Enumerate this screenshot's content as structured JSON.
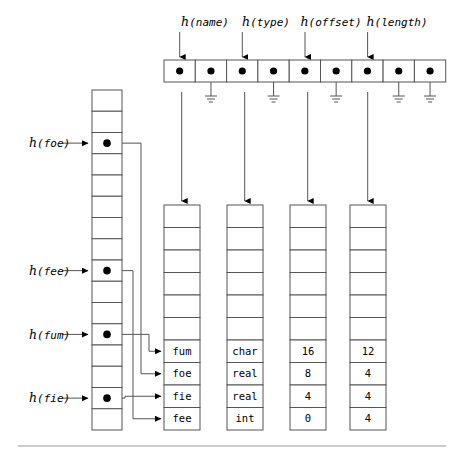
{
  "figure": {
    "bottom_rule": true
  },
  "hash_table": {
    "name": "top-hash-array",
    "cell_count": 9,
    "x": 164,
    "y": 60,
    "cell_width": 31.3,
    "cell_height": 22,
    "cells": [
      {
        "index": 0,
        "has_dot": true,
        "link": "name-column",
        "grounded": false
      },
      {
        "index": 1,
        "has_dot": true,
        "link": null,
        "grounded": true
      },
      {
        "index": 2,
        "has_dot": true,
        "link": "type-column",
        "grounded": false
      },
      {
        "index": 3,
        "has_dot": true,
        "link": null,
        "grounded": true
      },
      {
        "index": 4,
        "has_dot": true,
        "link": "offset-column",
        "grounded": false
      },
      {
        "index": 5,
        "has_dot": true,
        "link": null,
        "grounded": true
      },
      {
        "index": 6,
        "has_dot": true,
        "link": "length-column",
        "grounded": false
      },
      {
        "index": 7,
        "has_dot": true,
        "link": null,
        "grounded": true
      },
      {
        "index": 8,
        "has_dot": true,
        "link": null,
        "grounded": true
      }
    ]
  },
  "top_labels": [
    {
      "h": "h",
      "arg": "(name)",
      "text": "h(name)",
      "x": 205,
      "y": 26,
      "arrow_x": 179.7,
      "arrow_from_y": 32,
      "arrow_to_y": 57
    },
    {
      "h": "h",
      "arg": "(type)",
      "text": "h(type)",
      "x": 266,
      "y": 26,
      "arrow_x": 242.3,
      "arrow_from_y": 32,
      "arrow_to_y": 57
    },
    {
      "h": "h",
      "arg": "(offset)",
      "text": "h(offset)",
      "x": 331,
      "y": 26,
      "arrow_x": 305,
      "arrow_from_y": 32,
      "arrow_to_y": 57
    },
    {
      "h": "h",
      "arg": "(length)",
      "text": "h(length)",
      "x": 397,
      "y": 26,
      "arrow_x": 367.6,
      "arrow_from_y": 32,
      "arrow_to_y": 57
    }
  ],
  "left_table": {
    "name": "left-hash-array",
    "x": 92,
    "y": 90,
    "width": 30,
    "cell_count": 16,
    "cell_height": 21.25,
    "dot_rows": [
      2,
      8,
      11,
      14
    ]
  },
  "left_labels": [
    {
      "h": "h",
      "arg": "(foe)",
      "text": "h(foe)",
      "row": 2,
      "label_x": 29,
      "label_y": 151,
      "arrow_x1": 62,
      "arrow_x2": 88,
      "arrow_y": 147
    },
    {
      "h": "h",
      "arg": "(fee)",
      "text": "h(fee)",
      "row": 8,
      "label_x": 29,
      "label_y": 279,
      "arrow_x1": 62,
      "arrow_x2": 88,
      "arrow_y": 275
    },
    {
      "h": "h",
      "arg": "(fum)",
      "text": "h(fum)",
      "row": 11,
      "label_x": 29,
      "label_y": 343,
      "arrow_x1": 62,
      "arrow_x2": 88,
      "arrow_y": 339
    },
    {
      "h": "h",
      "arg": "(fie)",
      "text": "h(fie)",
      "row": 14,
      "label_x": 29,
      "label_y": 407,
      "arrow_x1": 62,
      "arrow_x2": 88,
      "arrow_y": 403
    }
  ],
  "record_columns": [
    {
      "name": "name-column",
      "key": "name",
      "x": 164,
      "y": 205,
      "width": 36,
      "cell_count": 10,
      "cell_height": 22.5,
      "empty_rows": 6,
      "values": [
        "fum",
        "foe",
        "fie",
        "fee"
      ],
      "arrow_x": 181.7,
      "has_incoming_arrows": true
    },
    {
      "name": "type-column",
      "key": "type",
      "x": 227,
      "y": 205,
      "width": 36,
      "cell_count": 10,
      "cell_height": 22.5,
      "empty_rows": 6,
      "values": [
        "char",
        "real",
        "real",
        "int"
      ],
      "arrow_x": 244.7,
      "has_incoming_arrows": false
    },
    {
      "name": "offset-column",
      "key": "offset",
      "x": 290,
      "y": 205,
      "width": 36,
      "cell_count": 10,
      "cell_height": 22.5,
      "empty_rows": 6,
      "values": [
        "16",
        "8",
        "4",
        "0"
      ],
      "arrow_x": 307.7,
      "has_incoming_arrows": false
    },
    {
      "name": "length-column",
      "key": "length",
      "x": 350,
      "y": 205,
      "width": 36,
      "cell_count": 10,
      "cell_height": 22.5,
      "empty_rows": 6,
      "values": [
        "12",
        "4",
        "4",
        "4"
      ],
      "arrow_x": 367.7,
      "has_incoming_arrows": false
    }
  ],
  "bucket_links": [
    {
      "from_label": "h(foe)",
      "to_value": "foe",
      "from_row": 2,
      "to_row": 7,
      "elbow_x": 141
    },
    {
      "from_label": "h(fee)",
      "to_value": "fee",
      "from_row": 8,
      "to_row": 9,
      "elbow_x": 133
    },
    {
      "from_label": "h(fum)",
      "to_value": "fum",
      "from_row": 11,
      "to_row": 6,
      "elbow_x": 149
    },
    {
      "from_label": "h(fie)",
      "to_value": "fie",
      "from_row": 14,
      "to_row": 8,
      "elbow_x": 125
    }
  ],
  "colors": {
    "stroke": "#555555",
    "dot": "#000000",
    "text": "#000000",
    "background": "#ffffff",
    "rule": "#999999"
  }
}
